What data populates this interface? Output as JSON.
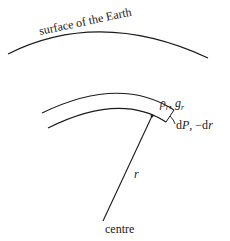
{
  "diagram": {
    "surface_label": "surface of the Earth",
    "shell_label_top": {
      "rho": "ρ",
      "rho_sub": "r",
      "sep": ", ",
      "g": "g",
      "g_sub": "r"
    },
    "shell_label_side": {
      "d": "d",
      "P": "P",
      "sep": ", ",
      "minus_dr": "−d",
      "r": "r"
    },
    "radius_label": "r",
    "centre_label": "centre",
    "colors": {
      "line": "#1a1a1a",
      "background": "#ffffff"
    }
  }
}
